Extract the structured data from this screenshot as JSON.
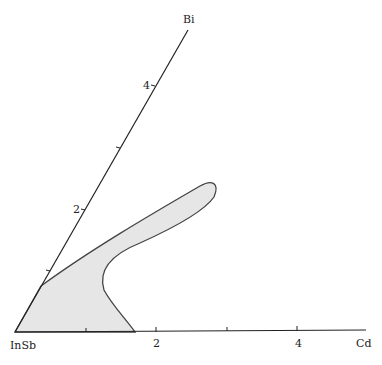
{
  "diagram": {
    "type": "ternary-section",
    "vertices": {
      "origin": "InSb",
      "right_axis": "Cd",
      "top_axis": "Bi"
    },
    "cd_axis": {
      "label": "Cd",
      "ticks": [
        "",
        "2",
        "",
        "4"
      ]
    },
    "bi_axis": {
      "label": "Bi",
      "ticks": [
        "",
        "2",
        "",
        "4"
      ]
    },
    "region": {
      "description": "shaded single-phase region extending from InSb corner",
      "fill": "#e6e6e6",
      "stroke": "#444444"
    },
    "colors": {
      "axis": "#222222"
    }
  }
}
